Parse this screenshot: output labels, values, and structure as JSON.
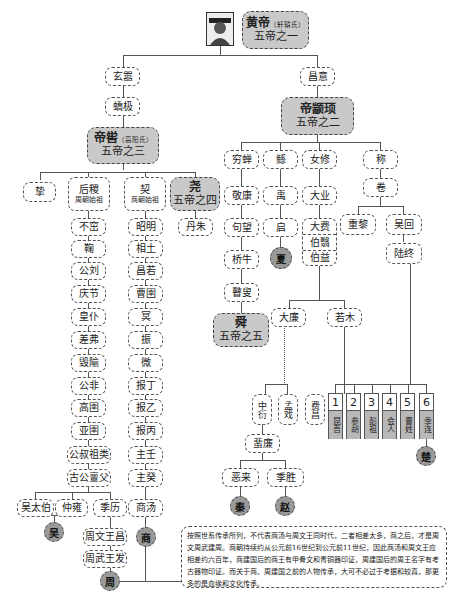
{
  "root": {
    "name": "黄帝",
    "clan": "（轩辕氏）",
    "title": "五帝之一",
    "portrait": "portrait-icon"
  },
  "branch_left": {
    "gen1": "玄嚣",
    "gen2": "蟜极",
    "emperor": {
      "name": "帝喾",
      "clan": "（高阳氏）",
      "title": "五帝之三"
    },
    "children": {
      "zhi": "挚",
      "houji": {
        "name": "后稷",
        "note": "周朝始祖"
      },
      "xie": {
        "name": "契",
        "note": "商朝始祖"
      },
      "yao": {
        "name": "尧",
        "title": "五帝之四"
      },
      "danzhu": "丹朱"
    },
    "zhou_line": [
      "不窋",
      "鞠",
      "公刘",
      "庆节",
      "皇仆",
      "差弗",
      "毁隃",
      "公非",
      "高圉",
      "亚圉",
      "公叔祖类",
      "古公亶父"
    ],
    "zhou_sons": [
      "吴太伯",
      "仲雍",
      "季历"
    ],
    "zhou_kings": [
      "周文王昌",
      "周武王发"
    ],
    "shang_line": [
      "昭明",
      "相土",
      "昌若",
      "曹圉",
      "冥",
      "振",
      "微",
      "报丁",
      "报乙",
      "报丙",
      "主壬",
      "主癸",
      "商汤"
    ],
    "states": {
      "wu": "吴",
      "shang": "商",
      "zhou": "周"
    }
  },
  "branch_right": {
    "gen1": "昌意",
    "emperor": {
      "name": "帝颛顼",
      "title": "五帝之二"
    },
    "children": [
      "穷蝉",
      "鲧",
      "女修",
      "称"
    ],
    "qiongchan_line": [
      "敬康",
      "句望",
      "桥牛",
      "瞽叟"
    ],
    "shun": {
      "name": "舜",
      "title": "五帝之五"
    },
    "gun_line": [
      "禹",
      "启"
    ],
    "xia": "夏",
    "nvxiu_line": [
      "大业",
      "大费",
      "伯翳",
      "伯益"
    ],
    "dafei_sons": [
      "大廉",
      "若木"
    ],
    "dalian_line": [
      "中衍",
      "孟戏"
    ],
    "zhongyan_line": "蜚廉",
    "feilian_sons": [
      "恶来",
      "季胜"
    ],
    "ruomu_son": "费昌",
    "states": {
      "qin": "秦",
      "zhao": "赵",
      "chu": "楚"
    },
    "cheng_line": [
      "卷"
    ],
    "juan_sons": [
      "重黎",
      "吴回"
    ],
    "wuhui_son": "陆终",
    "luzhong_sons": [
      {
        "num": "1",
        "name": "昆吾"
      },
      {
        "num": "2",
        "name": "参胡"
      },
      {
        "num": "3",
        "name": "彭祖"
      },
      {
        "num": "4",
        "name": "会人"
      },
      {
        "num": "5",
        "name": "曹姓"
      },
      {
        "num": "6",
        "name": "季连"
      }
    ]
  },
  "note": "按照世系传承所列，不代表商汤与周文王同时代，二者相差太多，商之后，才是周文周武建周。商朝持续约从公元前16世纪到公元前11世纪，因此商汤和周文王应相差约六百年，商建国后的商王有甲骨文和青铜器印证，周建国后的周王名字有考古器物印证。而关于商、周建国之前的人物传承，大可不必过于考据和较真，那更多的是血缘和文化传承。"
}
